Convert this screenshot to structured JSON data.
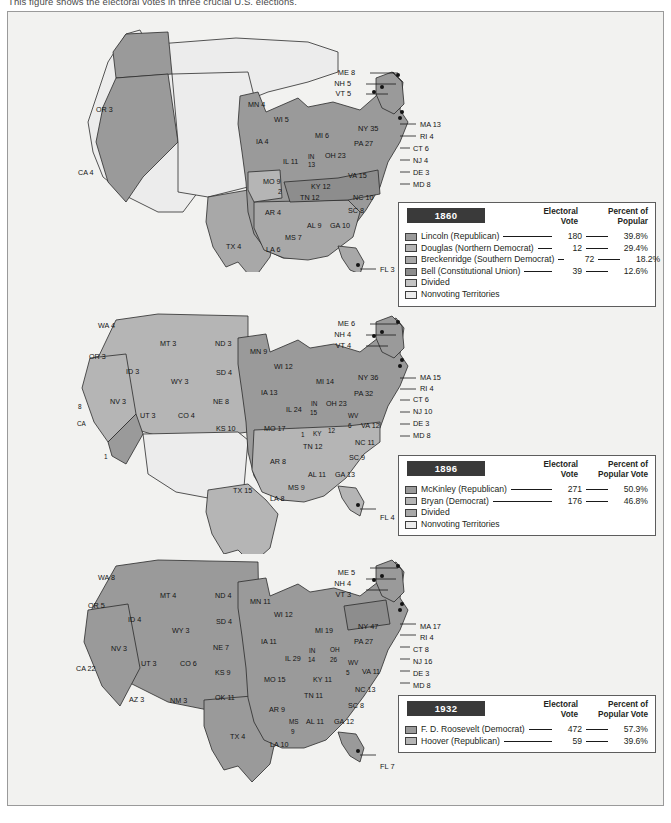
{
  "caption": "This figure shows the electoral votes in three crucial U.S. elections.",
  "colors": {
    "winner": "#9a9a9a",
    "second": "#b5b5b5",
    "third": "#a8a8a8",
    "fourth": "#8d8d8d",
    "divided": "#c4c4c4",
    "nonvoting": "#ececec",
    "panel": "#f2f2f0",
    "outline": "#2b2b2b",
    "year_tag_bg": "#3a3a3a"
  },
  "maps": [
    {
      "year": "1860",
      "states": [
        {
          "label": "OR 3",
          "x": 88,
          "y": 100,
          "fill": "#9a9a9a"
        },
        {
          "label": "CA 4",
          "x": 70,
          "y": 163,
          "fill": "#9a9a9a"
        },
        {
          "label": "TX 4",
          "x": 218,
          "y": 237,
          "fill": "#a8a8a8"
        },
        {
          "label": "MN 4",
          "x": 240,
          "y": 95,
          "fill": "#9a9a9a"
        },
        {
          "label": "WI 5",
          "x": 266,
          "y": 110,
          "fill": "#9a9a9a"
        },
        {
          "label": "IA 4",
          "x": 248,
          "y": 132,
          "fill": "#9a9a9a"
        },
        {
          "label": "MI 6",
          "x": 307,
          "y": 126,
          "fill": "#9a9a9a"
        },
        {
          "label": "IL 11",
          "x": 275,
          "y": 152,
          "fill": "#9a9a9a"
        },
        {
          "label": "IN",
          "x": 300,
          "y": 147,
          "fill": "#9a9a9a"
        },
        {
          "label": "13",
          "x": 300,
          "y": 155,
          "fill": "#9a9a9a"
        },
        {
          "label": "OH 23",
          "x": 317,
          "y": 146,
          "fill": "#9a9a9a"
        },
        {
          "label": "MO 9",
          "x": 255,
          "y": 172,
          "fill": "#b5b5b5"
        },
        {
          "label": "KY 12",
          "x": 303,
          "y": 177,
          "fill": "#8d8d8d"
        },
        {
          "label": "VA 15",
          "x": 340,
          "y": 166,
          "fill": "#8d8d8d"
        },
        {
          "label": "NC 10",
          "x": 345,
          "y": 188,
          "fill": "#a8a8a8"
        },
        {
          "label": "TN 12",
          "x": 292,
          "y": 188,
          "fill": "#8d8d8d"
        },
        {
          "label": "AR 4",
          "x": 257,
          "y": 203,
          "fill": "#a8a8a8"
        },
        {
          "label": "SC 8",
          "x": 340,
          "y": 201,
          "fill": "#a8a8a8"
        },
        {
          "label": "AL 9",
          "x": 299,
          "y": 216,
          "fill": "#a8a8a8"
        },
        {
          "label": "GA 10",
          "x": 322,
          "y": 216,
          "fill": "#a8a8a8"
        },
        {
          "label": "MS 7",
          "x": 277,
          "y": 228,
          "fill": "#a8a8a8"
        },
        {
          "label": "LA 6",
          "x": 258,
          "y": 240,
          "fill": "#a8a8a8"
        },
        {
          "label": "2",
          "x": 270,
          "y": 182,
          "fill": "#9a9a9a"
        }
      ],
      "callouts_left": [
        {
          "label": "ME 8",
          "x": 347,
          "y": 63
        },
        {
          "label": "NH 5",
          "x": 343,
          "y": 74
        },
        {
          "label": "VT 5",
          "x": 343,
          "y": 84
        }
      ],
      "callouts_right": [
        {
          "label": "MA 13",
          "x": 412,
          "y": 115
        },
        {
          "label": "RI 4",
          "x": 412,
          "y": 127
        },
        {
          "label": "CT 6",
          "x": 405,
          "y": 139
        },
        {
          "label": "NJ 4",
          "x": 405,
          "y": 151
        },
        {
          "label": "DE 3",
          "x": 405,
          "y": 163
        },
        {
          "label": "MD 8",
          "x": 405,
          "y": 175
        }
      ],
      "callouts_other": [
        {
          "label": "NY 35",
          "x": 350,
          "y": 119
        },
        {
          "label": "PA 27",
          "x": 346,
          "y": 134
        },
        {
          "label": "FL 3",
          "x": 372,
          "y": 260
        }
      ],
      "legend": {
        "year": "1860",
        "col1": "Electoral",
        "col1b": "Vote",
        "col2": "Percent of",
        "col2b": "Popular",
        "rows": [
          {
            "name": "Lincoln (Republican)",
            "electoral": "180",
            "percent": "39.8%",
            "swatch": "#9a9a9a"
          },
          {
            "name": "Douglas (Northern Democrat)",
            "electoral": "12",
            "percent": "29.4%",
            "swatch": "#b5b5b5"
          },
          {
            "name": "Breckenridge (Southern Democrat)",
            "electoral": "72",
            "percent": "18.2%",
            "swatch": "#a8a8a8"
          },
          {
            "name": "Bell (Constitutional Union)",
            "electoral": "39",
            "percent": "12.6%",
            "swatch": "#8d8d8d"
          },
          {
            "name": "Divided",
            "electoral": "",
            "percent": "",
            "swatch": "#c4c4c4"
          },
          {
            "name": "Nonvoting Territories",
            "electoral": "",
            "percent": "",
            "swatch": "#ececec"
          }
        ]
      }
    },
    {
      "year": "1896",
      "states": [
        {
          "label": "WA 4",
          "x": 90,
          "y": 316,
          "fill": "#b5b5b5"
        },
        {
          "label": "OR 3",
          "x": 81,
          "y": 347,
          "fill": "#9a9a9a"
        },
        {
          "label": "ID 3",
          "x": 118,
          "y": 362,
          "fill": "#b5b5b5"
        },
        {
          "label": "MT 3",
          "x": 152,
          "y": 334,
          "fill": "#b5b5b5"
        },
        {
          "label": "ND 3",
          "x": 207,
          "y": 334,
          "fill": "#9a9a9a"
        },
        {
          "label": "SD 4",
          "x": 208,
          "y": 363,
          "fill": "#b5b5b5"
        },
        {
          "label": "WY 3",
          "x": 163,
          "y": 372,
          "fill": "#b5b5b5"
        },
        {
          "label": "NV 3",
          "x": 102,
          "y": 392,
          "fill": "#b5b5b5"
        },
        {
          "label": "UT 3",
          "x": 132,
          "y": 406,
          "fill": "#b5b5b5"
        },
        {
          "label": "CO 4",
          "x": 170,
          "y": 406,
          "fill": "#b5b5b5"
        },
        {
          "label": "NE 8",
          "x": 205,
          "y": 392,
          "fill": "#9a9a9a"
        },
        {
          "label": "KS 10",
          "x": 208,
          "y": 419,
          "fill": "#9a9a9a"
        },
        {
          "label": "8",
          "x": 70,
          "y": 397,
          "fill": "#b5b5b5"
        },
        {
          "label": "CA",
          "x": 69,
          "y": 414,
          "fill": "#b5b5b5"
        },
        {
          "label": "1",
          "x": 96,
          "y": 447,
          "fill": "#9a9a9a"
        },
        {
          "label": "TX 15",
          "x": 225,
          "y": 481,
          "fill": "#b5b5b5"
        },
        {
          "label": "MN 9",
          "x": 242,
          "y": 342,
          "fill": "#9a9a9a"
        },
        {
          "label": "WI 12",
          "x": 266,
          "y": 357,
          "fill": "#9a9a9a"
        },
        {
          "label": "IA 13",
          "x": 253,
          "y": 383,
          "fill": "#9a9a9a"
        },
        {
          "label": "MI 14",
          "x": 308,
          "y": 372,
          "fill": "#9a9a9a"
        },
        {
          "label": "IL 24",
          "x": 278,
          "y": 400,
          "fill": "#9a9a9a"
        },
        {
          "label": "IN",
          "x": 303,
          "y": 394,
          "fill": "#9a9a9a"
        },
        {
          "label": "15",
          "x": 302,
          "y": 403,
          "fill": "#9a9a9a"
        },
        {
          "label": "OH 23",
          "x": 318,
          "y": 394,
          "fill": "#9a9a9a"
        },
        {
          "label": "MO 17",
          "x": 256,
          "y": 419,
          "fill": "#b5b5b5"
        },
        {
          "label": "WV",
          "x": 340,
          "y": 406,
          "fill": "#9a9a9a"
        },
        {
          "label": "6",
          "x": 340,
          "y": 416,
          "fill": "#9a9a9a"
        },
        {
          "label": "1",
          "x": 293,
          "y": 425,
          "fill": "#9a9a9a"
        },
        {
          "label": "KY",
          "x": 305,
          "y": 424,
          "fill": "#b5b5b5"
        },
        {
          "label": "12",
          "x": 320,
          "y": 421,
          "fill": "#b5b5b5"
        },
        {
          "label": "VA 12",
          "x": 353,
          "y": 416,
          "fill": "#b5b5b5"
        },
        {
          "label": "TN 12",
          "x": 295,
          "y": 437,
          "fill": "#b5b5b5"
        },
        {
          "label": "NC 11",
          "x": 347,
          "y": 433,
          "fill": "#b5b5b5"
        },
        {
          "label": "AR 8",
          "x": 262,
          "y": 452,
          "fill": "#b5b5b5"
        },
        {
          "label": "SC 9",
          "x": 341,
          "y": 448,
          "fill": "#b5b5b5"
        },
        {
          "label": "AL 11",
          "x": 300,
          "y": 465,
          "fill": "#b5b5b5"
        },
        {
          "label": "GA 13",
          "x": 327,
          "y": 465,
          "fill": "#b5b5b5"
        },
        {
          "label": "MS 9",
          "x": 280,
          "y": 478,
          "fill": "#b5b5b5"
        },
        {
          "label": "LA 8",
          "x": 262,
          "y": 489,
          "fill": "#b5b5b5"
        }
      ],
      "callouts_left": [
        {
          "label": "ME 6",
          "x": 347,
          "y": 314
        },
        {
          "label": "NH 4",
          "x": 343,
          "y": 325
        },
        {
          "label": "VT 4",
          "x": 343,
          "y": 336
        }
      ],
      "callouts_right": [
        {
          "label": "MA 15",
          "x": 412,
          "y": 368
        },
        {
          "label": "RI 4",
          "x": 412,
          "y": 379
        },
        {
          "label": "CT 6",
          "x": 405,
          "y": 390
        },
        {
          "label": "NJ 10",
          "x": 405,
          "y": 402
        },
        {
          "label": "DE 3",
          "x": 405,
          "y": 414
        },
        {
          "label": "MD 8",
          "x": 405,
          "y": 426
        }
      ],
      "callouts_other": [
        {
          "label": "NY 36",
          "x": 350,
          "y": 368
        },
        {
          "label": "PA 32",
          "x": 346,
          "y": 384
        },
        {
          "label": "FL 4",
          "x": 372,
          "y": 508
        }
      ],
      "legend": {
        "year": "1896",
        "col1": "Electoral",
        "col1b": "Vote",
        "col2": "Percent of",
        "col2b": "Popular Vote",
        "rows": [
          {
            "name": "McKinley (Republican)",
            "electoral": "271",
            "percent": "50.9%",
            "swatch": "#9a9a9a"
          },
          {
            "name": "Bryan (Democrat)",
            "electoral": "176",
            "percent": "46.8%",
            "swatch": "#b5b5b5"
          },
          {
            "name": "Divided",
            "electoral": "",
            "percent": "",
            "swatch": "#a8a8a8"
          },
          {
            "name": "Nonvoting Territories",
            "electoral": "",
            "percent": "",
            "swatch": "#ececec"
          }
        ]
      }
    },
    {
      "year": "1932",
      "states": [
        {
          "label": "WA 8",
          "x": 90,
          "y": 568,
          "fill": "#9a9a9a"
        },
        {
          "label": "OR 5",
          "x": 80,
          "y": 596,
          "fill": "#9a9a9a"
        },
        {
          "label": "ID 4",
          "x": 120,
          "y": 610,
          "fill": "#9a9a9a"
        },
        {
          "label": "MT 4",
          "x": 152,
          "y": 586,
          "fill": "#9a9a9a"
        },
        {
          "label": "ND 4",
          "x": 207,
          "y": 586,
          "fill": "#9a9a9a"
        },
        {
          "label": "SD 4",
          "x": 208,
          "y": 612,
          "fill": "#9a9a9a"
        },
        {
          "label": "WY 3",
          "x": 164,
          "y": 621,
          "fill": "#9a9a9a"
        },
        {
          "label": "NV 3",
          "x": 103,
          "y": 639,
          "fill": "#9a9a9a"
        },
        {
          "label": "UT 3",
          "x": 133,
          "y": 654,
          "fill": "#9a9a9a"
        },
        {
          "label": "CO 6",
          "x": 172,
          "y": 654,
          "fill": "#9a9a9a"
        },
        {
          "label": "NE 7",
          "x": 205,
          "y": 638,
          "fill": "#9a9a9a"
        },
        {
          "label": "KS 9",
          "x": 207,
          "y": 663,
          "fill": "#9a9a9a"
        },
        {
          "label": "CA 22",
          "x": 68,
          "y": 659,
          "fill": "#9a9a9a"
        },
        {
          "label": "AZ 3",
          "x": 121,
          "y": 690,
          "fill": "#9a9a9a"
        },
        {
          "label": "NM 3",
          "x": 162,
          "y": 691,
          "fill": "#9a9a9a"
        },
        {
          "label": "OK 11",
          "x": 207,
          "y": 688,
          "fill": "#9a9a9a"
        },
        {
          "label": "TX 4",
          "x": 222,
          "y": 727,
          "fill": "#9a9a9a"
        },
        {
          "label": "MN 11",
          "x": 242,
          "y": 592,
          "fill": "#9a9a9a"
        },
        {
          "label": "WI 12",
          "x": 266,
          "y": 605,
          "fill": "#9a9a9a"
        },
        {
          "label": "IA 11",
          "x": 253,
          "y": 632,
          "fill": "#9a9a9a"
        },
        {
          "label": "MI 19",
          "x": 307,
          "y": 621,
          "fill": "#9a9a9a"
        },
        {
          "label": "IL 29",
          "x": 277,
          "y": 649,
          "fill": "#9a9a9a"
        },
        {
          "label": "IN",
          "x": 301,
          "y": 641,
          "fill": "#9a9a9a"
        },
        {
          "label": "14",
          "x": 300,
          "y": 650,
          "fill": "#9a9a9a"
        },
        {
          "label": "OH",
          "x": 322,
          "y": 640,
          "fill": "#9a9a9a"
        },
        {
          "label": "26",
          "x": 322,
          "y": 650,
          "fill": "#9a9a9a"
        },
        {
          "label": "MO 15",
          "x": 256,
          "y": 670,
          "fill": "#9a9a9a"
        },
        {
          "label": "WV",
          "x": 340,
          "y": 653,
          "fill": "#9a9a9a"
        },
        {
          "label": "5",
          "x": 338,
          "y": 663,
          "fill": "#9a9a9a"
        },
        {
          "label": "KY 11",
          "x": 305,
          "y": 670,
          "fill": "#9a9a9a"
        },
        {
          "label": "VA 11",
          "x": 354,
          "y": 662,
          "fill": "#9a9a9a"
        },
        {
          "label": "NC 13",
          "x": 347,
          "y": 680,
          "fill": "#9a9a9a"
        },
        {
          "label": "TN 11",
          "x": 296,
          "y": 686,
          "fill": "#9a9a9a"
        },
        {
          "label": "AR 9",
          "x": 261,
          "y": 700,
          "fill": "#9a9a9a"
        },
        {
          "label": "SC 8",
          "x": 340,
          "y": 696,
          "fill": "#9a9a9a"
        },
        {
          "label": "AL 11",
          "x": 298,
          "y": 712,
          "fill": "#9a9a9a"
        },
        {
          "label": "GA 12",
          "x": 326,
          "y": 712,
          "fill": "#9a9a9a"
        },
        {
          "label": "MS",
          "x": 281,
          "y": 712,
          "fill": "#9a9a9a"
        },
        {
          "label": "9",
          "x": 283,
          "y": 722,
          "fill": "#9a9a9a"
        },
        {
          "label": "LA 10",
          "x": 262,
          "y": 735,
          "fill": "#9a9a9a"
        }
      ],
      "callouts_left": [
        {
          "label": "ME 5",
          "x": 347,
          "y": 563
        },
        {
          "label": "NH 4",
          "x": 343,
          "y": 574
        },
        {
          "label": "VT 3",
          "x": 343,
          "y": 585
        }
      ],
      "callouts_right": [
        {
          "label": "MA 17",
          "x": 412,
          "y": 617
        },
        {
          "label": "RI 4",
          "x": 412,
          "y": 628
        },
        {
          "label": "CT 8",
          "x": 405,
          "y": 640
        },
        {
          "label": "NJ 16",
          "x": 405,
          "y": 652
        },
        {
          "label": "DE 3",
          "x": 405,
          "y": 664
        },
        {
          "label": "MD 8",
          "x": 405,
          "y": 676
        }
      ],
      "callouts_other": [
        {
          "label": "NY 47",
          "x": 350,
          "y": 617
        },
        {
          "label": "PA 27",
          "x": 346,
          "y": 632
        },
        {
          "label": "FL 7",
          "x": 372,
          "y": 757
        }
      ],
      "legend": {
        "year": "1932",
        "col1": "Electoral",
        "col1b": "Vote",
        "col2": "Percent of",
        "col2b": "Popular Vote",
        "rows": [
          {
            "name": "F. D. Roosevelt (Democrat)",
            "electoral": "472",
            "percent": "57.3%",
            "swatch": "#9a9a9a"
          },
          {
            "name": "Hoover (Republican)",
            "electoral": "59",
            "percent": "39.6%",
            "swatch": "#b5b5b5"
          }
        ]
      }
    }
  ]
}
